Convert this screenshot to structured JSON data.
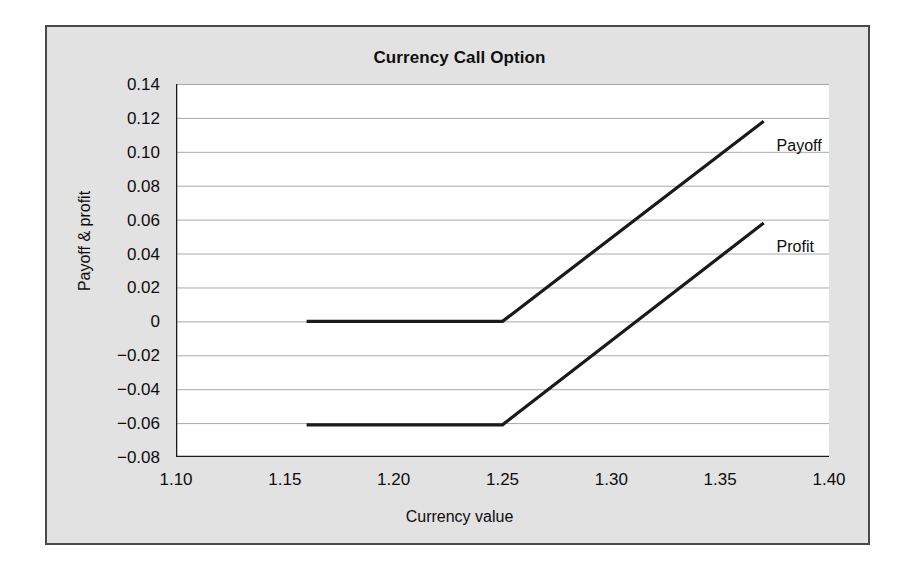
{
  "figure": {
    "background": "#ffffff",
    "panel_background": "#e2e2e2",
    "plot_background": "#ffffff",
    "border_color": "#4a4a4a",
    "line_color": "#1a1a1a",
    "gridline_color": "#aaaaaa"
  },
  "chart_data": {
    "type": "line",
    "title": "Currency Call Option",
    "xlabel": "Currency value",
    "ylabel": "Payoff & profit",
    "xlim": [
      1.1,
      1.4
    ],
    "ylim": [
      -0.08,
      0.14
    ],
    "xticks": [
      1.1,
      1.15,
      1.2,
      1.25,
      1.3,
      1.35,
      1.4
    ],
    "xtick_labels": [
      "1.10",
      "1.15",
      "1.20",
      "1.25",
      "1.30",
      "1.35",
      "1.40"
    ],
    "yticks": [
      0.14,
      0.12,
      0.1,
      0.08,
      0.06,
      0.04,
      0.02,
      0,
      -0.02,
      -0.04,
      -0.06,
      -0.08
    ],
    "ytick_labels": [
      "0.14",
      "0.12",
      "0.10",
      "0.08",
      "0.06",
      "0.04",
      "0.02",
      "0",
      "−0.02",
      "−0.04",
      "−0.06",
      "−0.08"
    ],
    "grid": true,
    "grid_axis": "y",
    "legend": "inline-end-labels",
    "strike": 1.25,
    "premium": 0.061,
    "series": [
      {
        "name": "Payoff",
        "label": "Payoff",
        "label_x": 1.375,
        "label_y": 0.103,
        "x": [
          1.16,
          1.25,
          1.37
        ],
        "y": [
          0,
          0,
          0.118
        ]
      },
      {
        "name": "Profit",
        "label": "Profit",
        "label_x": 1.375,
        "label_y": 0.043,
        "x": [
          1.16,
          1.25,
          1.37
        ],
        "y": [
          -0.061,
          -0.061,
          0.058
        ]
      }
    ]
  }
}
